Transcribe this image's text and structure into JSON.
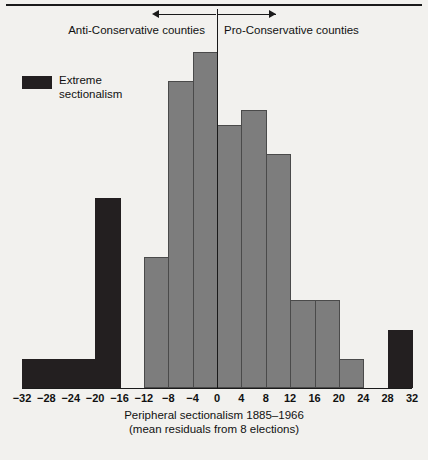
{
  "annotations": {
    "left_label": "Anti-Conservative counties",
    "right_label": "Pro-Conservative counties",
    "arrow_left_icon": "arrow-left-icon",
    "arrow_right_icon": "arrow-right-icon"
  },
  "legend": {
    "swatch_color": "#231f20",
    "label": "Extreme\nsectionalism"
  },
  "axis": {
    "title_line1": "Peripheral sectionalism 1885–1966",
    "title_line2": "(mean residuals from 8 elections)",
    "tick_labels": [
      "−32",
      "−28",
      "−24",
      "−20",
      "−16",
      "−12",
      "−8",
      "−4",
      "0",
      "4",
      "8",
      "12",
      "16",
      "20",
      "24",
      "28",
      "32"
    ]
  },
  "colors": {
    "background": "#f2f1ee",
    "bar_gray": "#7d7d7d",
    "bar_dark": "#231f20",
    "outline": "#4a4a4a",
    "rule": "#1a1a1a"
  },
  "chart_data": {
    "type": "bar",
    "title": "Peripheral sectionalism 1885–1966",
    "subtitle": "(mean residuals from 8 elections)",
    "xlabel": "Peripheral sectionalism 1885–1966 (mean residuals from 8 elections)",
    "ylabel": "Number of counties",
    "xlim": [
      -32,
      32
    ],
    "ylim": [
      0,
      23
    ],
    "bin_width": 4,
    "grid": false,
    "legend_position": "upper-left",
    "annotations": [
      {
        "text": "Anti-Conservative counties",
        "range": [
          -32,
          0
        ],
        "arrow": "left"
      },
      {
        "text": "Pro-Conservative counties",
        "range": [
          0,
          32
        ],
        "arrow": "right"
      }
    ],
    "series": [
      {
        "name": "Extreme sectionalism",
        "color": "#231f20",
        "bins": [
          {
            "x0": -32,
            "x1": -28,
            "value": 2
          },
          {
            "x0": -28,
            "x1": -24,
            "value": 2
          },
          {
            "x0": -24,
            "x1": -20,
            "value": 2
          },
          {
            "x0": -20,
            "x1": -16,
            "value": 13
          },
          {
            "x0": 28,
            "x1": 32,
            "value": 4
          }
        ]
      },
      {
        "name": "Other counties",
        "color": "#7d7d7d",
        "bins": [
          {
            "x0": -16,
            "x1": -12,
            "value": 0
          },
          {
            "x0": -12,
            "x1": -8,
            "value": 9
          },
          {
            "x0": -8,
            "x1": -4,
            "value": 21
          },
          {
            "x0": -4,
            "x1": 0,
            "value": 23
          },
          {
            "x0": 0,
            "x1": 4,
            "value": 18
          },
          {
            "x0": 4,
            "x1": 8,
            "value": 19
          },
          {
            "x0": 8,
            "x1": 12,
            "value": 16
          },
          {
            "x0": 12,
            "x1": 16,
            "value": 6
          },
          {
            "x0": 16,
            "x1": 20,
            "value": 6
          },
          {
            "x0": 20,
            "x1": 24,
            "value": 2
          },
          {
            "x0": 24,
            "x1": 28,
            "value": 0
          }
        ]
      }
    ],
    "all_bins": [
      {
        "x0": -32,
        "x1": -28,
        "value": 2,
        "kind": "dark"
      },
      {
        "x0": -28,
        "x1": -24,
        "value": 2,
        "kind": "dark"
      },
      {
        "x0": -24,
        "x1": -20,
        "value": 2,
        "kind": "dark"
      },
      {
        "x0": -20,
        "x1": -16,
        "value": 13,
        "kind": "dark"
      },
      {
        "x0": -16,
        "x1": -12,
        "value": 0,
        "kind": "gray"
      },
      {
        "x0": -12,
        "x1": -8,
        "value": 9,
        "kind": "gray"
      },
      {
        "x0": -8,
        "x1": -4,
        "value": 21,
        "kind": "gray"
      },
      {
        "x0": -4,
        "x1": 0,
        "value": 23,
        "kind": "gray"
      },
      {
        "x0": 0,
        "x1": 4,
        "value": 18,
        "kind": "gray"
      },
      {
        "x0": 4,
        "x1": 8,
        "value": 19,
        "kind": "gray"
      },
      {
        "x0": 8,
        "x1": 12,
        "value": 16,
        "kind": "gray"
      },
      {
        "x0": 12,
        "x1": 16,
        "value": 6,
        "kind": "gray"
      },
      {
        "x0": 16,
        "x1": 20,
        "value": 6,
        "kind": "gray"
      },
      {
        "x0": 20,
        "x1": 24,
        "value": 2,
        "kind": "gray"
      },
      {
        "x0": 24,
        "x1": 28,
        "value": 0,
        "kind": "gray"
      },
      {
        "x0": 28,
        "x1": 32,
        "value": 4,
        "kind": "dark"
      }
    ]
  }
}
